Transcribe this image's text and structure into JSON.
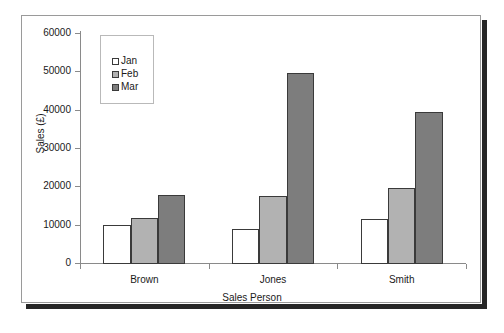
{
  "chart_data": {
    "type": "bar",
    "title": "",
    "xlabel": "Sales Person",
    "ylabel": "Sales (£)",
    "categories": [
      "Brown",
      "Jones",
      "Smith"
    ],
    "series": [
      {
        "name": "Jan",
        "color": "#ffffff",
        "values": [
          10000,
          8800,
          11500
        ]
      },
      {
        "name": "Feb",
        "color": "#b2b2b2",
        "values": [
          11800,
          17500,
          19600
        ]
      },
      {
        "name": "Mar",
        "color": "#7d7d7d",
        "values": [
          17700,
          49600,
          39300
        ]
      }
    ],
    "ylim": [
      0,
      60000
    ],
    "ytick_labels": [
      "0",
      "10000",
      "20000",
      "30000",
      "40000",
      "50000",
      "60000"
    ],
    "ytick_values": [
      0,
      10000,
      20000,
      30000,
      40000,
      50000,
      60000
    ],
    "grid": false,
    "legend_position": "upper-left-inside"
  },
  "legend": {
    "entries": [
      {
        "label": "Jan"
      },
      {
        "label": "Feb"
      },
      {
        "label": "Mar"
      }
    ]
  },
  "axes": {
    "y_title": "Sales (£)",
    "x_title": "Sales Person"
  }
}
